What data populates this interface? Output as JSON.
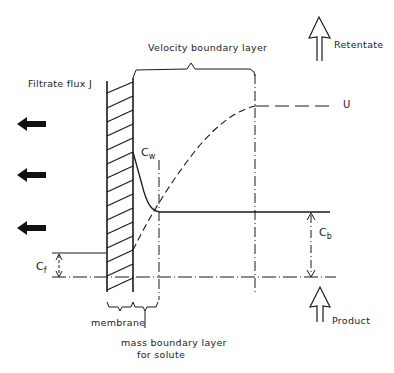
{
  "labels": {
    "velocity_boundary_layer": "Velocity boundary layer",
    "retentate": "Retentate",
    "filtrate_flux": "Filtrate flux J",
    "u": "U",
    "cw_main": "C",
    "cw_sub": "w",
    "cb_main": "C",
    "cb_sub": "b",
    "cf_main": "C",
    "cf_sub": "f",
    "membrane": "membrane",
    "mass_boundary_line1": "mass boundary layer",
    "mass_boundary_line2": "for solute",
    "product": "Product"
  },
  "icons": {
    "flux_arrows": [
      "left-arrow-icon",
      "left-arrow-icon",
      "left-arrow-icon"
    ],
    "retentate_arrow": "up-hollow-arrow-icon",
    "product_arrow": "up-hollow-arrow-icon"
  },
  "colors": {
    "ink": "#1a1a1a",
    "background": "#ffffff"
  }
}
